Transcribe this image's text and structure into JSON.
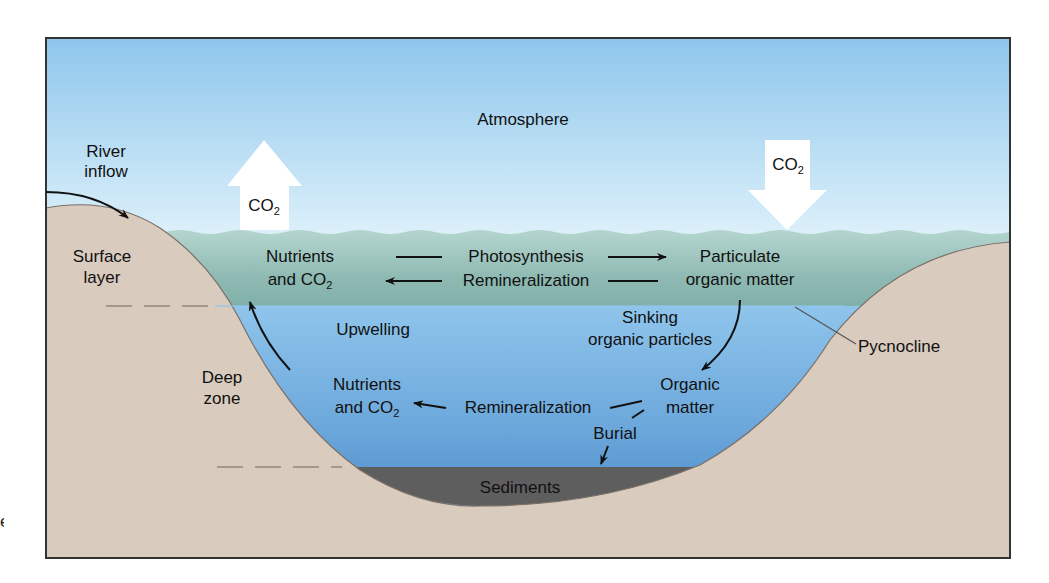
{
  "figure": {
    "title": "",
    "colors": {
      "sky_top": "#8ec6ec",
      "sky_bottom": "#d8eef9",
      "surface_layer_top": "#a9cfc7",
      "surface_layer_bottom": "#7fb2aa",
      "deep_zone_top": "#8cc3ea",
      "deep_zone_bottom": "#3f82c1",
      "land": "#d9cbbd",
      "sediments": "#5e5e5e",
      "frame": "#333333",
      "arrow_co2": "#ffffff"
    },
    "labels": {
      "atmosphere": "Atmosphere",
      "river_inflow_1": "River",
      "river_inflow_2": "inflow",
      "co2_up": "CO",
      "co2_up_sub": "2",
      "co2_down": "CO",
      "co2_down_sub": "2",
      "surface_layer_1": "Surface",
      "surface_layer_2": "layer",
      "deep_zone_1": "Deep",
      "deep_zone_2": "zone",
      "nutrients_top_1": "Nutrients",
      "nutrients_top_2": "and CO",
      "nutrients_top_sub": "2",
      "photosynthesis": "Photosynthesis",
      "remineralization_top": "Remineralization",
      "particulate_1": "Particulate",
      "particulate_2": "organic matter",
      "upwelling": "Upwelling",
      "sinking_1": "Sinking",
      "sinking_2": "organic particles",
      "nutrients_bottom_1": "Nutrients",
      "nutrients_bottom_2": "and CO",
      "nutrients_bottom_sub": "2",
      "remineralization_bottom": "Remineralization",
      "organic_matter_1": "Organic",
      "organic_matter_2": "matter",
      "burial": "Burial",
      "sediments": "Sediments",
      "pycnocline": "Pycnocline",
      "edge_fragment": "e"
    }
  }
}
